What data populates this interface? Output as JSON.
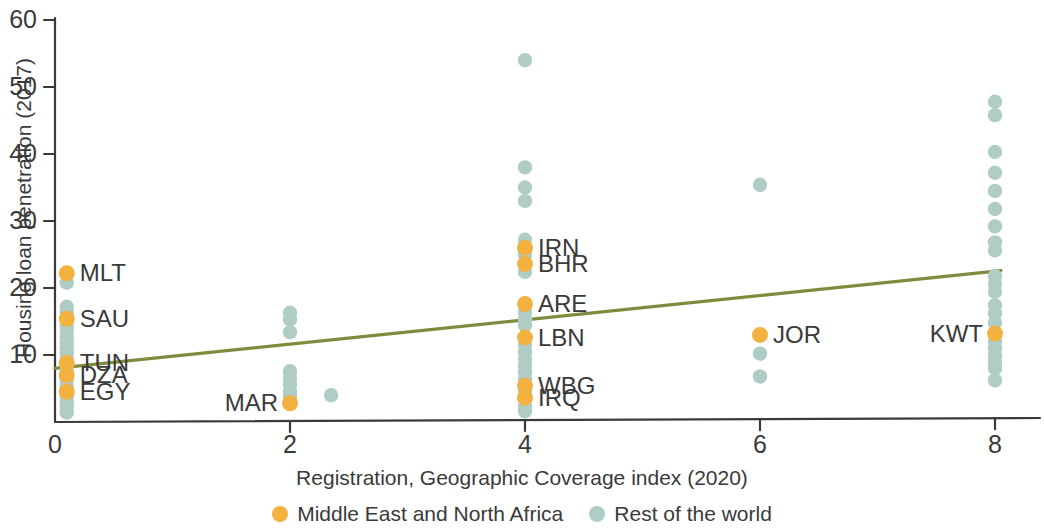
{
  "chart_data": {
    "type": "scatter",
    "title": "",
    "xlabel": "Registration, Geographic Coverage index (2020)",
    "ylabel": "Housing loan penetration (2017)",
    "xlim": [
      -0.25,
      8.6
    ],
    "ylim": [
      0,
      60
    ],
    "xticks": [
      0,
      2,
      4,
      6,
      8
    ],
    "xtick_labels": [
      "0",
      "2",
      "4",
      "6",
      "8"
    ],
    "yticks": [
      10,
      20,
      30,
      40,
      50,
      60
    ],
    "ytick_labels": [
      "10",
      "20",
      "30",
      "40",
      "50",
      "60"
    ],
    "grid": false,
    "legend_position": "bottom-center",
    "colors": {
      "mena": "#F3B13F",
      "rest": "#AFCCC6",
      "trendline": "#7E8C3E",
      "axis": "#3a3a3a",
      "text": "#3a3a3a"
    },
    "series": [
      {
        "name": "Middle East and North Africa",
        "color": "#F3B13F",
        "points": [
          {
            "x": 0.1,
            "y": 22.2,
            "label": "MLT",
            "label_side": "right"
          },
          {
            "x": 0.1,
            "y": 15.4,
            "label": "SAU",
            "label_side": "right"
          },
          {
            "x": 0.1,
            "y": 8.8,
            "label": "TUN",
            "label_side": "right"
          },
          {
            "x": 0.1,
            "y": 7.0,
            "label": "DZA",
            "label_side": "right"
          },
          {
            "x": 0.1,
            "y": 4.5,
            "label": "EGY",
            "label_side": "right"
          },
          {
            "x": 2.0,
            "y": 2.8,
            "label": "MAR",
            "label_side": "left"
          },
          {
            "x": 4.0,
            "y": 26.0,
            "label": "IRN",
            "label_side": "right"
          },
          {
            "x": 4.0,
            "y": 23.6,
            "label": "BHR",
            "label_side": "right"
          },
          {
            "x": 4.0,
            "y": 17.6,
            "label": "ARE",
            "label_side": "right"
          },
          {
            "x": 4.0,
            "y": 12.6,
            "label": "LBN",
            "label_side": "right"
          },
          {
            "x": 4.0,
            "y": 5.4,
            "label": "WBG",
            "label_side": "right"
          },
          {
            "x": 4.0,
            "y": 3.6,
            "label": "IRQ",
            "label_side": "right"
          },
          {
            "x": 6.0,
            "y": 13.0,
            "label": "JOR",
            "label_side": "right"
          },
          {
            "x": 8.0,
            "y": 13.2,
            "label": "KWT",
            "label_side": "left"
          }
        ]
      },
      {
        "name": "Rest of the world",
        "color": "#AFCCC6",
        "points": [
          {
            "x": 0.1,
            "y": 20.8
          },
          {
            "x": 0.1,
            "y": 17.2
          },
          {
            "x": 0.1,
            "y": 16.4
          },
          {
            "x": 0.1,
            "y": 15.8
          },
          {
            "x": 0.1,
            "y": 14.4
          },
          {
            "x": 0.1,
            "y": 13.6
          },
          {
            "x": 0.1,
            "y": 12.6
          },
          {
            "x": 0.1,
            "y": 11.8
          },
          {
            "x": 0.1,
            "y": 11.0
          },
          {
            "x": 0.1,
            "y": 10.2
          },
          {
            "x": 0.1,
            "y": 9.4
          },
          {
            "x": 0.1,
            "y": 8.6
          },
          {
            "x": 0.1,
            "y": 7.8
          },
          {
            "x": 0.1,
            "y": 7.0
          },
          {
            "x": 0.1,
            "y": 6.2
          },
          {
            "x": 0.1,
            "y": 5.4
          },
          {
            "x": 0.1,
            "y": 4.6
          },
          {
            "x": 0.1,
            "y": 3.8
          },
          {
            "x": 0.1,
            "y": 3.0
          },
          {
            "x": 0.1,
            "y": 2.2
          },
          {
            "x": 0.1,
            "y": 1.4
          },
          {
            "x": 2.0,
            "y": 16.3
          },
          {
            "x": 2.0,
            "y": 15.3
          },
          {
            "x": 2.0,
            "y": 13.4
          },
          {
            "x": 2.0,
            "y": 7.6
          },
          {
            "x": 2.0,
            "y": 6.6
          },
          {
            "x": 2.0,
            "y": 5.6
          },
          {
            "x": 2.0,
            "y": 4.6
          },
          {
            "x": 2.0,
            "y": 3.8
          },
          {
            "x": 2.35,
            "y": 4.0
          },
          {
            "x": 4.0,
            "y": 54.0
          },
          {
            "x": 4.0,
            "y": 38.0
          },
          {
            "x": 4.0,
            "y": 35.0
          },
          {
            "x": 4.0,
            "y": 33.0
          },
          {
            "x": 4.0,
            "y": 27.2
          },
          {
            "x": 4.0,
            "y": 25.0
          },
          {
            "x": 4.0,
            "y": 22.4
          },
          {
            "x": 4.0,
            "y": 16.4
          },
          {
            "x": 4.0,
            "y": 15.4
          },
          {
            "x": 4.0,
            "y": 14.4
          },
          {
            "x": 4.0,
            "y": 11.4
          },
          {
            "x": 4.0,
            "y": 10.4
          },
          {
            "x": 4.0,
            "y": 9.4
          },
          {
            "x": 4.0,
            "y": 8.4
          },
          {
            "x": 4.0,
            "y": 7.4
          },
          {
            "x": 4.0,
            "y": 6.4
          },
          {
            "x": 4.0,
            "y": 4.6
          },
          {
            "x": 4.0,
            "y": 2.4
          },
          {
            "x": 4.0,
            "y": 1.6
          },
          {
            "x": 6.0,
            "y": 35.4
          },
          {
            "x": 6.0,
            "y": 10.2
          },
          {
            "x": 6.0,
            "y": 6.8
          },
          {
            "x": 8.0,
            "y": 47.8
          },
          {
            "x": 8.0,
            "y": 45.8
          },
          {
            "x": 8.0,
            "y": 40.3
          },
          {
            "x": 8.0,
            "y": 37.2
          },
          {
            "x": 8.0,
            "y": 34.5
          },
          {
            "x": 8.0,
            "y": 31.8
          },
          {
            "x": 8.0,
            "y": 29.2
          },
          {
            "x": 8.0,
            "y": 26.8
          },
          {
            "x": 8.0,
            "y": 25.6
          },
          {
            "x": 8.0,
            "y": 21.8
          },
          {
            "x": 8.0,
            "y": 20.6
          },
          {
            "x": 8.0,
            "y": 19.4
          },
          {
            "x": 8.0,
            "y": 17.4
          },
          {
            "x": 8.0,
            "y": 16.2
          },
          {
            "x": 8.0,
            "y": 14.8
          },
          {
            "x": 8.0,
            "y": 12.0
          },
          {
            "x": 8.0,
            "y": 11.0
          },
          {
            "x": 8.0,
            "y": 10.0
          },
          {
            "x": 8.0,
            "y": 9.0
          },
          {
            "x": 8.0,
            "y": 8.0
          },
          {
            "x": 8.0,
            "y": 6.2
          }
        ]
      }
    ],
    "trendline": {
      "name": "linear fit",
      "color": "#7E8C3E",
      "x0": 0.0,
      "y0": 8.0,
      "x1": 8.05,
      "y1": 22.6
    },
    "legend": [
      {
        "label": "Middle East and North Africa",
        "color": "#F3B13F",
        "marker": "circle"
      },
      {
        "label": "Rest of the world",
        "color": "#AFCCC6",
        "marker": "circle"
      }
    ]
  }
}
